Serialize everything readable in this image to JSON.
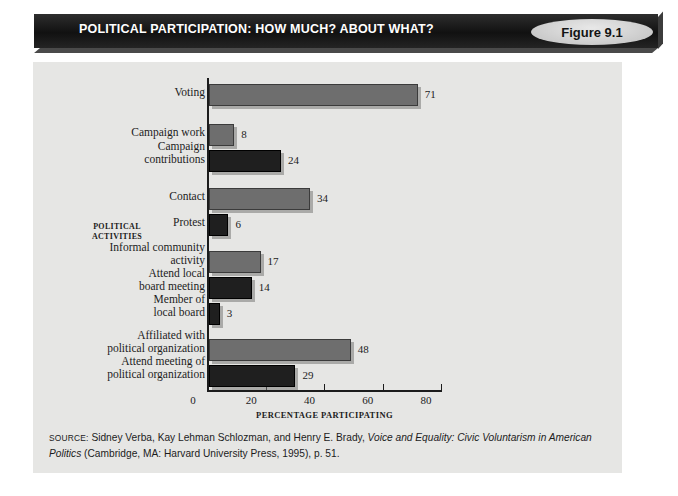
{
  "header": {
    "title": "POLITICAL PARTICIPATION: HOW MUCH? ABOUT WHAT?",
    "figure_badge": "Figure 9.1",
    "banner_color": "#1a1a1a",
    "badge_color": "#d2d2d2"
  },
  "chart_data": {
    "type": "bar",
    "orientation": "horizontal",
    "title": "POLITICAL PARTICIPATION: HOW MUCH? ABOUT WHAT?",
    "xlabel": "PERCENTAGE PARTICIPATING",
    "ylabel": "POLITICAL ACTIVITIES",
    "xlim": [
      0,
      80
    ],
    "xticks": [
      0,
      20,
      40,
      60,
      80
    ],
    "grid": false,
    "legend": "none",
    "categories": [
      "Voting",
      "Campaign work",
      "Campaign contributions",
      "Contact",
      "Protest",
      "Informal community activity",
      "Attend local board meeting",
      "Member of local board",
      "Affiliated with political organization",
      "Attend meeting of political organization"
    ],
    "values": [
      71,
      8,
      24,
      34,
      6,
      17,
      14,
      3,
      48,
      29
    ],
    "bar_colors": [
      "#6e6e6e",
      "#6e6e6e",
      "#1f1f1f",
      "#6e6e6e",
      "#1f1f1f",
      "#6e6e6e",
      "#1f1f1f",
      "#1f1f1f",
      "#6e6e6e",
      "#1f1f1f"
    ]
  },
  "bars": [
    {
      "label_line1": "Voting",
      "label_line2": "",
      "value": "71",
      "top": 22,
      "height": 20,
      "style": "bar-gray",
      "label_top": 24
    },
    {
      "label_line1": "Campaign work",
      "label_line2": "",
      "value": "8",
      "top": 62,
      "height": 20,
      "style": "bar-gray",
      "label_top": 64
    },
    {
      "label_line1": "Campaign",
      "label_line2": "contributions",
      "value": "24",
      "top": 88,
      "height": 20,
      "style": "bar-dark",
      "label_top": 78
    },
    {
      "label_line1": "Contact",
      "label_line2": "",
      "value": "34",
      "top": 126,
      "height": 20,
      "style": "bar-gray",
      "label_top": 128
    },
    {
      "label_line1": "Protest",
      "label_line2": "",
      "value": "6",
      "top": 152,
      "height": 20,
      "style": "bar-dark",
      "label_top": 154
    },
    {
      "label_line1": "Informal community",
      "label_line2": "activity",
      "value": "17",
      "top": 189,
      "height": 20,
      "style": "bar-gray",
      "label_top": 179
    },
    {
      "label_line1": "Attend local",
      "label_line2": "board meeting",
      "value": "14",
      "top": 215,
      "height": 20,
      "style": "bar-dark",
      "label_top": 205
    },
    {
      "label_line1": "Member of",
      "label_line2": "local board",
      "value": "3",
      "top": 241,
      "height": 20,
      "style": "bar-dark",
      "label_top": 231
    },
    {
      "label_line1": "Affiliated with",
      "label_line2": "political organization",
      "value": "48",
      "top": 277,
      "height": 20,
      "style": "bar-gray",
      "label_top": 267
    },
    {
      "label_line1": "Attend meeting of",
      "label_line2": "political organization",
      "value": "29",
      "top": 303,
      "height": 20,
      "style": "bar-dark",
      "label_top": 293
    }
  ],
  "axis": {
    "y_title_line1": "POLITICAL",
    "y_title_line2": "ACTIVITIES",
    "x_title": "PERCENTAGE PARTICIPATING",
    "ticks": [
      {
        "label": "0",
        "value": 0
      },
      {
        "label": "20",
        "value": 20
      },
      {
        "label": "40",
        "value": 40
      },
      {
        "label": "60",
        "value": 60
      },
      {
        "label": "80",
        "value": 80
      }
    ]
  },
  "source": {
    "prefix": "SOURCE:",
    "text_1": " Sidney Verba, Kay Lehman Schlozman, and Henry E. Brady, ",
    "italic_1": "Voice and Equality: Civic Voluntarism in American Politics",
    "text_2": " (Cambridge, MA: Harvard University Press, 1995), p. 51."
  }
}
